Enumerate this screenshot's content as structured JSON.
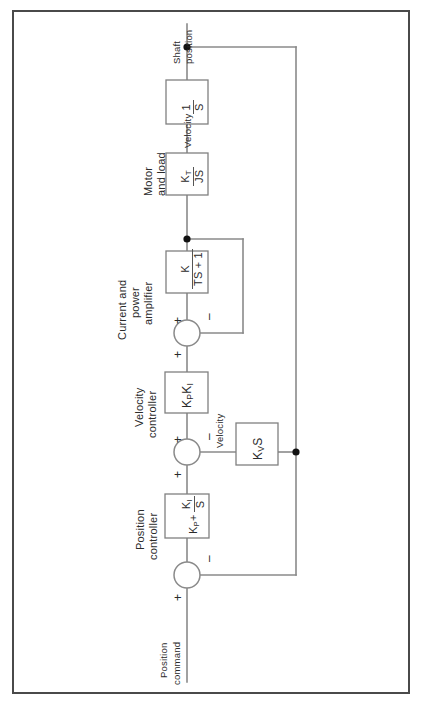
{
  "frame": {
    "border_color": "#4a4a4a"
  },
  "colors": {
    "line": "#8a8a8a",
    "text": "#2b2b2b",
    "node": "#111111",
    "block_border": "#808080"
  },
  "signals": {
    "input_label_line1": "Position",
    "input_label_line2": "command",
    "output_label_line1": "Shaft",
    "output_label_line2": "position",
    "velocity_feedback_label": "Velocity",
    "velocity_out_label": "Velocity"
  },
  "blocks": [
    {
      "id": "position-controller",
      "title_line1": "Position",
      "title_line2": "controller",
      "expr_lead": "K",
      "expr_lead_sub": "P",
      "expr_plus": "+",
      "numerator": "K",
      "numerator_sub": "I",
      "denominator": "S"
    },
    {
      "id": "velocity-controller",
      "title_line1": "Velocity",
      "title_line2": "controller",
      "expr": "K",
      "expr_sub1": "P",
      "expr2": "K",
      "expr_sub2": "I"
    },
    {
      "id": "current-power-amplifier",
      "title_line1": "Current and",
      "title_line2": "power",
      "title_line3": "amplifier",
      "numerator": "K",
      "denominator": "TS + 1"
    },
    {
      "id": "motor-and-load",
      "title_line1": "Motor",
      "title_line2": "and load",
      "numerator": "K",
      "numerator_sub": "T",
      "denominator": "JS"
    },
    {
      "id": "integrator",
      "numerator": "1",
      "denominator": "S"
    },
    {
      "id": "velocity-feedback-gain",
      "expr": "K",
      "expr_sub": "V",
      "expr_tail": "S"
    }
  ],
  "summing_junctions": [
    {
      "id": "position-error-junction",
      "plus": "+",
      "minus": "–"
    },
    {
      "id": "velocity-error-junction",
      "plus_left": "+",
      "plus_bottom": "+",
      "minus": "–"
    },
    {
      "id": "current-error-junction",
      "plus_left": "+",
      "plus_bottom": "+",
      "minus": "–"
    }
  ]
}
